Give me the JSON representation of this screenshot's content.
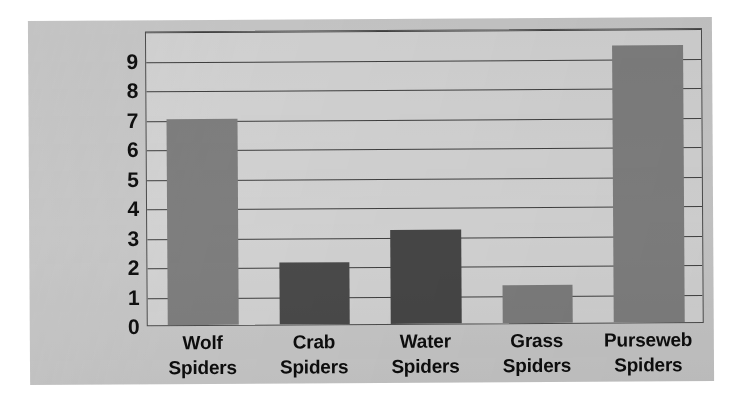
{
  "chart_data": {
    "type": "bar",
    "title": "",
    "xlabel": "",
    "ylabel": "",
    "categories": [
      "Wolf Spiders",
      "Crab Spiders",
      "Water Spiders",
      "Grass Spiders",
      "Purseweb Spiders"
    ],
    "category_lines": [
      [
        "Wolf",
        "Spiders"
      ],
      [
        "Crab",
        "Spiders"
      ],
      [
        "Water",
        "Spiders"
      ],
      [
        "Grass",
        "Spiders"
      ],
      [
        "Purseweb",
        "Spiders"
      ]
    ],
    "values": [
      7.0,
      2.1,
      3.2,
      1.3,
      9.4
    ],
    "bar_colors": [
      "#7e7e7e",
      "#4a4a4a",
      "#464646",
      "#7c7c7c",
      "#7e7e7e"
    ],
    "ylim": [
      0,
      10
    ],
    "yticks": [
      0,
      1,
      2,
      3,
      4,
      5,
      6,
      7,
      8,
      9
    ],
    "ytick_labels": [
      "0",
      "1",
      "2",
      "3",
      "4",
      "5",
      "6",
      "7",
      "8",
      "9"
    ],
    "gridlines": [
      0,
      1,
      2,
      3,
      4,
      5,
      6,
      7,
      8,
      9,
      10
    ],
    "grid": true,
    "legend": false,
    "legend_position": "none",
    "plot_background": "#d2d2d2",
    "card_background": "#c6c6c6",
    "axis_color": "#3f3f3f"
  }
}
